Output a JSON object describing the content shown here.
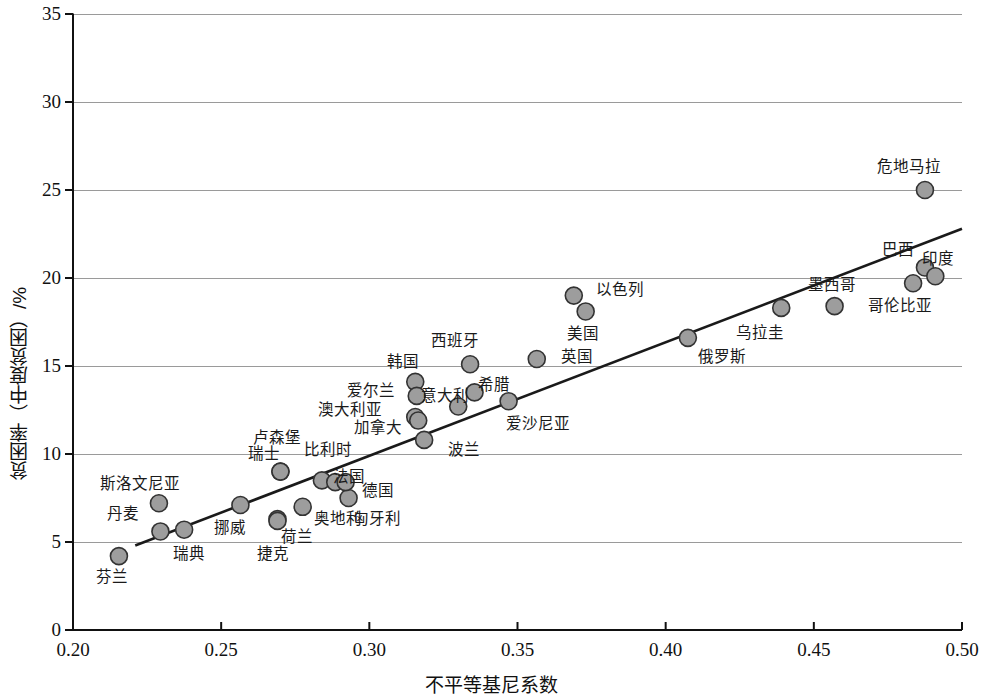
{
  "chart_data": {
    "type": "scatter",
    "title": "",
    "xlabel": "不平等基尼系数",
    "ylabel": "贫困率（中度贫困）/%",
    "xlim": [
      0.2,
      0.5
    ],
    "ylim": [
      0,
      35
    ],
    "xticks": [
      "0.20",
      "0.25",
      "0.30",
      "0.35",
      "0.40",
      "0.45",
      "0.50"
    ],
    "xtick_values": [
      0.2,
      0.25,
      0.3,
      0.35,
      0.4,
      0.45,
      0.5
    ],
    "yticks": [
      "0",
      "5",
      "10",
      "15",
      "20",
      "25",
      "30",
      "35"
    ],
    "ytick_values": [
      0,
      5,
      10,
      15,
      20,
      25,
      30,
      35
    ],
    "grid": "horizontal",
    "legend": "none",
    "marker_fill": "#9d9d9d",
    "marker_edge": "#333333",
    "trendline": {
      "label": "",
      "x0": 0.221,
      "y0": 4.8,
      "x1": 0.5,
      "y1": 22.8,
      "color": "#1a1a1a"
    },
    "points": [
      {
        "label": "芬兰",
        "x": 0.2155,
        "y": 4.2,
        "lx": 0.213,
        "ly": 3.0,
        "anchor": "middle"
      },
      {
        "label": "丹麦",
        "x": 0.2295,
        "y": 5.6,
        "lx": 0.217,
        "ly": 6.6,
        "anchor": "middle"
      },
      {
        "label": "瑞典",
        "x": 0.2375,
        "y": 5.7,
        "lx": 0.239,
        "ly": 4.3,
        "anchor": "middle"
      },
      {
        "label": "斯洛文尼亚",
        "x": 0.229,
        "y": 7.2,
        "lx": 0.2225,
        "ly": 8.3,
        "anchor": "middle"
      },
      {
        "label": "挪威",
        "x": 0.2565,
        "y": 7.1,
        "lx": 0.253,
        "ly": 5.8,
        "anchor": "middle"
      },
      {
        "label": "瑞士",
        "x": 0.27,
        "y": 9.0,
        "lx": 0.2645,
        "ly": 10.0,
        "anchor": "middle"
      },
      {
        "label": "卢森堡",
        "x": 0.27,
        "y": 9.0,
        "lx": 0.269,
        "ly": 10.9,
        "anchor": "middle"
      },
      {
        "label": "捷克",
        "x": 0.269,
        "y": 6.3,
        "lx": 0.2675,
        "ly": 4.3,
        "anchor": "middle"
      },
      {
        "label": "荷兰",
        "x": 0.269,
        "y": 6.2,
        "lx": 0.2755,
        "ly": 5.3,
        "anchor": "middle"
      },
      {
        "label": "奥地利",
        "x": 0.2775,
        "y": 7.0,
        "lx": 0.2895,
        "ly": 6.3,
        "anchor": "middle"
      },
      {
        "label": "比利时",
        "x": 0.284,
        "y": 8.5,
        "lx": 0.286,
        "ly": 10.2,
        "anchor": "middle"
      },
      {
        "label": "法国",
        "x": 0.2885,
        "y": 8.4,
        "lx": 0.293,
        "ly": 8.7,
        "anchor": "middle"
      },
      {
        "label": "德国",
        "x": 0.293,
        "y": 7.5,
        "lx": 0.303,
        "ly": 7.9,
        "anchor": "middle"
      },
      {
        "label": "匈牙利",
        "x": 0.292,
        "y": 8.4,
        "lx": 0.3025,
        "ly": 6.3,
        "anchor": "middle"
      },
      {
        "label": "韩国",
        "x": 0.3155,
        "y": 14.1,
        "lx": 0.3115,
        "ly": 15.2,
        "anchor": "middle"
      },
      {
        "label": "爱尔兰",
        "x": 0.316,
        "y": 13.3,
        "lx": 0.3005,
        "ly": 13.6,
        "anchor": "middle"
      },
      {
        "label": "澳大利亚",
        "x": 0.3155,
        "y": 12.1,
        "lx": 0.2935,
        "ly": 12.5,
        "anchor": "middle"
      },
      {
        "label": "加拿大",
        "x": 0.3165,
        "y": 11.9,
        "lx": 0.303,
        "ly": 11.5,
        "anchor": "middle"
      },
      {
        "label": "波兰",
        "x": 0.3185,
        "y": 10.8,
        "lx": 0.332,
        "ly": 10.2,
        "anchor": "middle"
      },
      {
        "label": "意大利",
        "x": 0.33,
        "y": 12.7,
        "lx": 0.3255,
        "ly": 13.3,
        "anchor": "middle"
      },
      {
        "label": "希腊",
        "x": 0.3355,
        "y": 13.5,
        "lx": 0.342,
        "ly": 13.9,
        "anchor": "middle"
      },
      {
        "label": "西班牙",
        "x": 0.334,
        "y": 15.1,
        "lx": 0.329,
        "ly": 16.4,
        "anchor": "middle"
      },
      {
        "label": "爱沙尼亚",
        "x": 0.347,
        "y": 13.0,
        "lx": 0.357,
        "ly": 11.7,
        "anchor": "middle"
      },
      {
        "label": "英国",
        "x": 0.3565,
        "y": 15.4,
        "lx": 0.37,
        "ly": 15.5,
        "anchor": "middle"
      },
      {
        "label": "以色列",
        "x": 0.369,
        "y": 19.0,
        "lx": 0.3845,
        "ly": 19.3,
        "anchor": "middle"
      },
      {
        "label": "美国",
        "x": 0.373,
        "y": 18.1,
        "lx": 0.372,
        "ly": 16.8,
        "anchor": "middle"
      },
      {
        "label": "俄罗斯",
        "x": 0.4075,
        "y": 16.6,
        "lx": 0.419,
        "ly": 15.5,
        "anchor": "middle"
      },
      {
        "label": "乌拉圭",
        "x": 0.439,
        "y": 18.3,
        "lx": 0.432,
        "ly": 16.9,
        "anchor": "middle"
      },
      {
        "label": "墨西哥",
        "x": 0.457,
        "y": 18.4,
        "lx": 0.456,
        "ly": 19.6,
        "anchor": "middle"
      },
      {
        "label": "哥伦比亚",
        "x": 0.4835,
        "y": 19.7,
        "lx": 0.479,
        "ly": 18.4,
        "anchor": "middle"
      },
      {
        "label": "巴西",
        "x": 0.4875,
        "y": 20.6,
        "lx": 0.4785,
        "ly": 21.6,
        "anchor": "middle"
      },
      {
        "label": "印度",
        "x": 0.491,
        "y": 20.1,
        "lx": 0.492,
        "ly": 21.1,
        "anchor": "middle"
      },
      {
        "label": "危地马拉",
        "x": 0.4875,
        "y": 25.0,
        "lx": 0.482,
        "ly": 26.3,
        "anchor": "middle"
      }
    ]
  }
}
